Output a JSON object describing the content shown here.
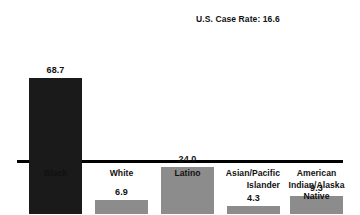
{
  "chart_data": {
    "type": "bar",
    "title": "",
    "subtitle": "",
    "xlabel": "",
    "ylabel": "",
    "ylim": [
      0,
      70
    ],
    "grid": false,
    "legend": "none",
    "categories": [
      "Black",
      "White",
      "Latino",
      "Asian/Pacific Islander",
      "American Indian/Alaska Native"
    ],
    "values": [
      68.7,
      6.9,
      24.0,
      4.3,
      9.3
    ],
    "value_labels": [
      "68.7",
      "6.9",
      "24.0",
      "4.3",
      "9.3"
    ],
    "bar_colors": [
      "#1a1a1a",
      "#8c8c8c",
      "#8c8c8c",
      "#8c8c8c",
      "#8c8c8c"
    ],
    "annotations": [
      {
        "text": "U.S. Case Rate: 16.6",
        "value": 16.6,
        "position": "top-right"
      }
    ],
    "category_lines": [
      {
        "lines": [
          "Black"
        ],
        "align": "center"
      },
      {
        "lines": [
          "White"
        ],
        "align": "center"
      },
      {
        "lines": [
          "Latino"
        ],
        "align": "center"
      },
      {
        "lines": [
          "Asian/Pacific",
          "Islander"
        ],
        "align": "right"
      },
      {
        "lines": [
          "American",
          "Indian/Alaska",
          "Native"
        ],
        "align": "center"
      }
    ]
  },
  "axis": {
    "baseline_color": "#000000"
  }
}
